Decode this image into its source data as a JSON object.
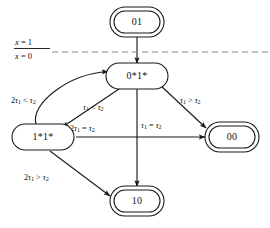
{
  "diagram": {
    "background_color": "#ffffff",
    "line_color": "#1a1a1a",
    "divider_color": "#8a8a8a",
    "nodes": [
      {
        "id": "01",
        "label": "01",
        "shape": "double-rounded-rect",
        "x": 137,
        "y": 22
      },
      {
        "id": "0*1*",
        "label": "0*1*",
        "shape": "rounded-rect",
        "x": 137,
        "y": 76
      },
      {
        "id": "1*1*",
        "label": "1*1*",
        "shape": "rounded-rect",
        "x": 43,
        "y": 137
      },
      {
        "id": "00",
        "label": "00",
        "shape": "double-rounded-rect",
        "x": 232,
        "y": 137
      },
      {
        "id": "10",
        "label": "10",
        "shape": "double-rounded-rect",
        "x": 137,
        "y": 200
      }
    ],
    "divider": {
      "type": "dashed-horizontal-line",
      "above_label": "x = 1",
      "below_label": "x = 0",
      "above_var": "x",
      "above_eq": "= 1",
      "below_var": "x",
      "below_eq": "= 0"
    },
    "edges": [
      {
        "id": "e1",
        "from": "01",
        "to": "0*1*",
        "label": "",
        "style": "straight",
        "arrow": true
      },
      {
        "id": "e2",
        "from": "1*1*",
        "to": "0*1*",
        "label": "2τ₁ < τ₂",
        "label_parts": {
          "lead": "2",
          "v1": "τ",
          "s1": "1",
          "op": "<",
          "v2": "τ",
          "s2": "2"
        },
        "style": "curved",
        "arrow": true
      },
      {
        "id": "e3",
        "from": "0*1*",
        "to": "1*1*",
        "label": "τ₁ < τ₂",
        "label_parts": {
          "lead": "",
          "v1": "τ",
          "s1": "1",
          "op": "<",
          "v2": "τ",
          "s2": "2"
        },
        "style": "straight",
        "arrow": true
      },
      {
        "id": "e4",
        "from": "0*1*",
        "to": "00",
        "label": "τ₁ > τ₂",
        "label_parts": {
          "lead": "",
          "v1": "τ",
          "s1": "1",
          "op": ">",
          "v2": "τ",
          "s2": "2"
        },
        "style": "straight",
        "arrow": true
      },
      {
        "id": "e5",
        "from": "0*1*",
        "to": "10",
        "label": "τ₁ = τ₂",
        "label_parts": {
          "lead": "",
          "v1": "τ",
          "s1": "1",
          "op": "=",
          "v2": "τ",
          "s2": "2"
        },
        "style": "straight",
        "arrow": true
      },
      {
        "id": "e6",
        "from": "1*1*",
        "to": "00",
        "label": "2τ₁ = τ₂",
        "label_parts": {
          "lead": "2",
          "v1": "τ",
          "s1": "1",
          "op": "=",
          "v2": "τ",
          "s2": "2"
        },
        "style": "straight",
        "arrow": true
      },
      {
        "id": "e7",
        "from": "1*1*",
        "to": "10",
        "label": "2τ₁ > τ₂",
        "label_parts": {
          "lead": "2",
          "v1": "τ",
          "s1": "1",
          "op": ">",
          "v2": "τ",
          "s2": "2"
        },
        "style": "straight",
        "arrow": true
      }
    ]
  }
}
